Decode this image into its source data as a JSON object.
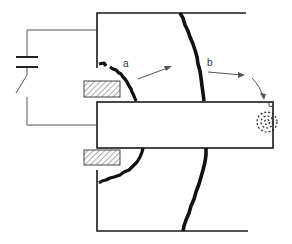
{
  "diagram": {
    "type": "schematic",
    "labels": {
      "a": "a",
      "b": "b",
      "c": "c"
    },
    "components": [
      {
        "name": "capacitor",
        "symbol": "parallel-plates"
      },
      {
        "name": "switch",
        "symbol": "open-switch"
      },
      {
        "name": "chamber",
        "symbol": "open-box"
      },
      {
        "name": "central-electrode",
        "symbol": "rectangle"
      },
      {
        "name": "insulator-upper",
        "symbol": "hatched-rectangle"
      },
      {
        "name": "insulator-lower",
        "symbol": "hatched-rectangle"
      },
      {
        "name": "front-a",
        "symbol": "jagged-arc"
      },
      {
        "name": "front-b",
        "symbol": "jagged-arc"
      },
      {
        "name": "particle-cloud-c",
        "symbol": "dashed-circles"
      }
    ],
    "colors": {
      "line": "#1a1a1a",
      "front": "#111111",
      "hatch": "#555555",
      "background": "#ffffff"
    }
  }
}
